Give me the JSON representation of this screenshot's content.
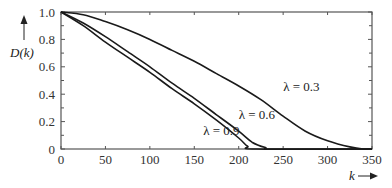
{
  "chart_data": {
    "type": "line",
    "title": "",
    "xlabel": "k",
    "ylabel": "D(k)",
    "xlim": [
      0,
      350
    ],
    "ylim": [
      0,
      1.0
    ],
    "x_ticks": [
      0,
      50,
      100,
      150,
      200,
      250,
      300,
      350
    ],
    "y_ticks": [
      0,
      0.2,
      0.4,
      0.6,
      0.8,
      1.0
    ],
    "x_tick_labels": [
      "0",
      "50",
      "100",
      "150",
      "200",
      "250",
      "300",
      "350"
    ],
    "y_tick_labels": [
      "0",
      "0.2",
      "0.4",
      "0.6",
      "0.8",
      "1.0"
    ],
    "grid": false,
    "legend": "none (inline annotations)",
    "series": [
      {
        "name": "λ = 0.3",
        "label": "λ = 0.3",
        "x": [
          0,
          25,
          50,
          75,
          100,
          125,
          150,
          175,
          200,
          225,
          250,
          275,
          300,
          325,
          340,
          350
        ],
        "values": [
          1.0,
          0.98,
          0.93,
          0.87,
          0.8,
          0.72,
          0.64,
          0.55,
          0.46,
          0.36,
          0.24,
          0.13,
          0.06,
          0.015,
          0.0,
          0.0
        ]
      },
      {
        "name": "λ = 0.6",
        "label": "λ = 0.6",
        "x": [
          0,
          25,
          50,
          75,
          100,
          125,
          150,
          175,
          200,
          215,
          230,
          240,
          350
        ],
        "values": [
          1.0,
          0.92,
          0.82,
          0.71,
          0.6,
          0.48,
          0.37,
          0.25,
          0.13,
          0.05,
          0.01,
          0.0,
          0.0
        ]
      },
      {
        "name": "λ = 0.9",
        "label": "λ = 0.9",
        "x": [
          0,
          25,
          50,
          75,
          100,
          125,
          150,
          175,
          200,
          210,
          220,
          350
        ],
        "values": [
          1.0,
          0.9,
          0.78,
          0.67,
          0.56,
          0.44,
          0.33,
          0.21,
          0.08,
          0.02,
          0.0,
          0.0
        ]
      }
    ],
    "annotations": [
      {
        "text": "λ = 0.3",
        "x": 250,
        "y": 0.42
      },
      {
        "text": "λ = 0.6",
        "x": 200,
        "y": 0.22
      },
      {
        "text": "λ = 0.9",
        "x": 160,
        "y": 0.1
      }
    ]
  },
  "axes": {
    "x_title": "k",
    "y_title": "D(k)",
    "x_arrow": "→",
    "y_arrow": "↑"
  }
}
